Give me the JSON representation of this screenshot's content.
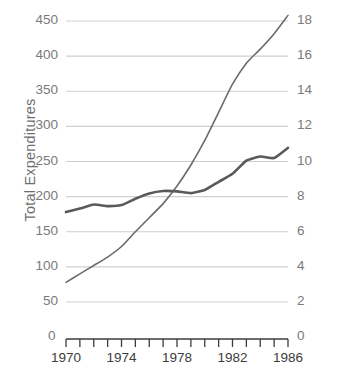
{
  "chart_data": {
    "type": "line",
    "title": "",
    "xlabel": "",
    "ylabel": "Total Expenditures",
    "y2label": "Percent of Gross National Product",
    "grid": true,
    "legend": "none",
    "x": [
      1970,
      1971,
      1972,
      1973,
      1974,
      1975,
      1976,
      1977,
      1978,
      1979,
      1980,
      1981,
      1982,
      1983,
      1984,
      1985,
      1986
    ],
    "xlim": [
      1970,
      1986
    ],
    "xticks": [
      1970,
      1971,
      1972,
      1973,
      1974,
      1975,
      1976,
      1977,
      1978,
      1979,
      1980,
      1981,
      1982,
      1983,
      1984,
      1985,
      1986
    ],
    "xticklabels": [
      "1970",
      "",
      "",
      "",
      "1974",
      "",
      "",
      "",
      "1978",
      "",
      "",
      "",
      "1982",
      "",
      "",
      "",
      "1986"
    ],
    "ylim": [
      0,
      450
    ],
    "yticks": [
      0,
      50,
      100,
      150,
      200,
      250,
      300,
      350,
      400,
      450
    ],
    "yticklabels": [
      "0",
      "50",
      "100",
      "150",
      "200",
      "250",
      "300",
      "350",
      "400",
      "450"
    ],
    "y2lim": [
      0,
      18
    ],
    "y2ticks": [
      0,
      2,
      4,
      6,
      8,
      10,
      12,
      14,
      16,
      18
    ],
    "y2ticklabels": [
      "0",
      "2",
      "4",
      "6",
      "8",
      "10",
      "12",
      "14",
      "16",
      "18"
    ],
    "series": [
      {
        "name": "Total Expenditures",
        "axis": "left",
        "color": "#6b6b6b",
        "linewidth": 1.6,
        "values": [
          78,
          90,
          102,
          114,
          129,
          150,
          170,
          190,
          215,
          245,
          280,
          320,
          360,
          390,
          410,
          432,
          458
        ]
      },
      {
        "name": "Percent of Gross National Product",
        "axis": "right",
        "color": "#5a5a5a",
        "linewidth": 2.6,
        "values": [
          7.12,
          7.32,
          7.55,
          7.46,
          7.52,
          7.88,
          8.18,
          8.32,
          8.3,
          8.2,
          8.38,
          8.84,
          9.3,
          10.05,
          10.28,
          10.2,
          10.78
        ]
      }
    ]
  },
  "axes": {
    "left_title": "Total Expenditures",
    "right_title": "Percent of Gross National Product",
    "left_zero": "0",
    "right_zero": "0"
  },
  "colors": {
    "gridline": "#cfcfcf",
    "axis": "#3c3c3c",
    "tick_text": "#7a7a7a",
    "series_expenditures": "#6b6b6b",
    "series_percent": "#5a5a5a",
    "background": "#ffffff"
  }
}
